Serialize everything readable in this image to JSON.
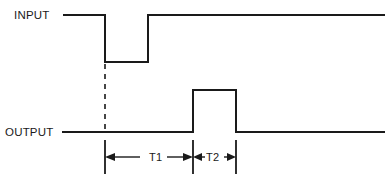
{
  "diagram": {
    "type": "timing-diagram",
    "background_color": "#ffffff",
    "line_color": "#1a1a1a",
    "signals": [
      {
        "name": "input",
        "label": "INPUT",
        "idle_state": "high",
        "description": "Active-low pulse: falls then returns high",
        "transitions": [
          {
            "edge": "falling",
            "x": 105
          },
          {
            "edge": "rising",
            "x": 148
          }
        ],
        "high_y": 15,
        "low_y": 62,
        "start_x": 63,
        "end_x": 385
      },
      {
        "name": "output",
        "label": "OUTPUT",
        "idle_state": "low",
        "description": "Active-high pulse delayed from input falling edge",
        "transitions": [
          {
            "edge": "rising",
            "x": 193
          },
          {
            "edge": "falling",
            "x": 236
          }
        ],
        "high_y": 90,
        "low_y": 132,
        "start_x": 62,
        "end_x": 385
      }
    ],
    "reference_line": {
      "name": "input-falling-edge-reference",
      "style": "dashed",
      "x": 105,
      "y_start": 62,
      "y_end": 132
    },
    "intervals": [
      {
        "name": "T1",
        "label": "T1",
        "from_x": 105,
        "to_x": 193,
        "meaning": "delay from input falling edge to output rising edge",
        "arrows": "outward-pair"
      },
      {
        "name": "T2",
        "label": "T2",
        "from_x": 193,
        "to_x": 236,
        "meaning": "output pulse width",
        "arrows": "inward-pair"
      }
    ],
    "dimension_line_y": 157,
    "tick_marks": [
      {
        "name": "tick-t1-start",
        "x": 105,
        "y_top": 140,
        "y_bottom": 174
      },
      {
        "name": "tick-t1-end-t2-start",
        "x": 193,
        "y_top": 140,
        "y_bottom": 174
      },
      {
        "name": "tick-t2-end",
        "x": 236,
        "y_top": 140,
        "y_bottom": 174
      }
    ]
  }
}
